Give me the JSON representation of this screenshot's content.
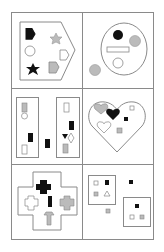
{
  "colors": {
    "background": "#ffffff",
    "line": "#8a8a8a",
    "black": "#111111",
    "gray": "#b8b8b8",
    "white": "#ffffff"
  },
  "grid": {
    "rows": 3,
    "cols": 2,
    "cells": [
      {
        "id": "cell-1",
        "container": "pentagon",
        "items": [
          "black-pentagon",
          "gray-star",
          "white-circle",
          "white-pentagon",
          "black-star",
          "gray-pentagon"
        ]
      },
      {
        "id": "cell-2",
        "container": "circle",
        "items": [
          "black-circle",
          "gray-circle",
          "white-rectangle",
          "white-circle",
          "gray-circle-outside"
        ]
      },
      {
        "id": "cell-3",
        "container": "two-rectangles",
        "items": [
          "gray-rect",
          "white-circle",
          "black-rect",
          "white-rect",
          "black-rect-outside",
          "white-rect",
          "black-rect",
          "black-heart",
          "white-diamond",
          "gray-rect"
        ]
      },
      {
        "id": "cell-4",
        "container": "heart",
        "items": [
          "gray-heart",
          "black-heart",
          "white-square",
          "black-square",
          "white-heart",
          "gray-square"
        ]
      },
      {
        "id": "cell-5",
        "container": "cross",
        "items": [
          "black-cross",
          "black-rect",
          "white-cross",
          "gray-cross",
          "gray-arrow"
        ]
      },
      {
        "id": "cell-6",
        "container": "two-squares",
        "items": [
          "white-square",
          "black-square",
          "gray-square",
          "white-triangle",
          "black-square-outside",
          "gray-square-outside",
          "black-square",
          "white-square",
          "gray-square"
        ]
      }
    ]
  }
}
